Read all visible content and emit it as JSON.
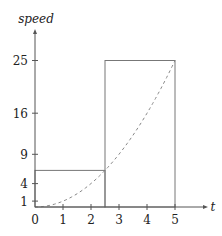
{
  "chart_data": {
    "type": "line",
    "title": "",
    "xlabel": "t",
    "ylabel": "speed",
    "xlim": [
      0,
      5.3
    ],
    "ylim": [
      0,
      27
    ],
    "x_ticks": [
      0,
      1,
      2,
      3,
      4,
      5
    ],
    "x_tick_labels": [
      "0",
      "1",
      "2",
      "3",
      "4",
      "5"
    ],
    "y_ticks": [
      1,
      4,
      9,
      16,
      25
    ],
    "y_tick_labels": [
      "1",
      "4",
      "9",
      "16",
      "25"
    ],
    "grid": false,
    "legend": null,
    "series": [
      {
        "name": "speed curve",
        "style": "dashed",
        "function": "t^2",
        "x": [
          0,
          0.5,
          1,
          1.5,
          2,
          2.5,
          3,
          3.5,
          4,
          4.5,
          5
        ],
        "values": [
          0,
          0.25,
          1,
          2.25,
          4,
          6.25,
          9,
          12.25,
          16,
          20.25,
          25
        ]
      }
    ],
    "rectangles": [
      {
        "name": "left-rectangle",
        "x_start": 0,
        "x_end": 2.5,
        "height": 6.25
      },
      {
        "name": "right-rectangle",
        "x_start": 2.5,
        "x_end": 5,
        "height": 25
      }
    ]
  },
  "labels": {
    "ylabel": "speed",
    "xlabel": "t",
    "x_ticks": [
      "0",
      "1",
      "2",
      "3",
      "4",
      "5"
    ],
    "y_ticks": [
      "1",
      "4",
      "9",
      "16",
      "25"
    ]
  }
}
